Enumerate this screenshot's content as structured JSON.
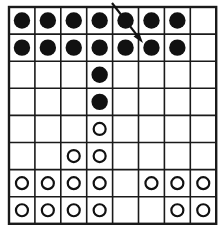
{
  "figure": {
    "name": "dot-grid-diagram",
    "type": "grid-of-markers",
    "background_color": "#ffffff",
    "line_color": "#1a1a1a",
    "marker_filled_color": "#111111",
    "marker_open_stroke_color": "#111111",
    "marker_open_fill_color": "#ffffff"
  },
  "grid": {
    "columns": 8,
    "rows": 8,
    "column_labels": [
      "1",
      "2",
      "3",
      "4",
      "5",
      "6",
      "7",
      "8"
    ],
    "row_labels": [
      "1",
      "2",
      "3",
      "4",
      "5",
      "6",
      "7",
      "8"
    ],
    "origin_x": 9,
    "origin_y": 7,
    "cell_width": 25.9,
    "cell_height": 27.1,
    "outer_border_width": 2.4,
    "inner_line_width": 1.6
  },
  "markers": {
    "legend": {
      "filled": "filled-dot",
      "open": "open-circle",
      "empty": "empty-cell"
    },
    "filled_radius": 8.2,
    "open_radius": 6.0,
    "open_stroke_width": 2.2,
    "cells": [
      [
        "filled",
        "filled",
        "filled",
        "filled",
        "filled",
        "filled",
        "filled",
        "empty"
      ],
      [
        "filled",
        "filled",
        "filled",
        "filled",
        "filled",
        "filled",
        "filled",
        "empty"
      ],
      [
        "empty",
        "empty",
        "empty",
        "filled",
        "empty",
        "empty",
        "empty",
        "empty"
      ],
      [
        "empty",
        "empty",
        "empty",
        "filled",
        "empty",
        "empty",
        "empty",
        "empty"
      ],
      [
        "empty",
        "empty",
        "empty",
        "open",
        "empty",
        "empty",
        "empty",
        "empty"
      ],
      [
        "empty",
        "empty",
        "open",
        "open",
        "empty",
        "empty",
        "empty",
        "empty"
      ],
      [
        "open",
        "open",
        "open",
        "open",
        "empty",
        "open",
        "open",
        "open"
      ],
      [
        "open",
        "open",
        "open",
        "open",
        "empty",
        "empty",
        "open",
        "open"
      ]
    ],
    "counts": {
      "filled": 16,
      "open": 16,
      "empty": 32
    }
  },
  "arrow": {
    "name": "diagonal-arrow",
    "start_x": 112,
    "start_y": 3,
    "end_x": 143,
    "end_y": 43,
    "stroke_width": 2.2,
    "color": "#111111",
    "head_length": 11,
    "head_width": 7,
    "direction": "down-right",
    "points_from": "row 1 column 4",
    "points_to": "row 2 column 5"
  }
}
